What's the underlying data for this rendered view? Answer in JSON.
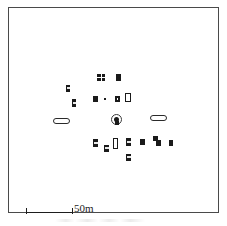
{
  "figure": {
    "width": 227,
    "height": 226,
    "background_color": "#ffffff",
    "frame_color": "#4a4a4a"
  },
  "scalebar": {
    "label": "50m",
    "bar_length_px": 47,
    "represents_meters": 50,
    "tick_style": "end-ticks",
    "color": "#1d1d1d"
  },
  "chart_data": {
    "type": "scatter",
    "subtitle": "",
    "xlabel": "",
    "ylabel": "",
    "grid": false,
    "legend_position": "none",
    "units": "meters",
    "scale_label": "50m",
    "axis_visible": false,
    "frame": true,
    "xlim": [
      0,
      211
    ],
    "ylim": [
      0,
      206
    ],
    "note": "Plan view of structures; coordinates are plot-area pixel positions with origin at the frame top-left.",
    "markers": [
      {
        "id": "s01",
        "style": "grid",
        "x": 88,
        "y": 66,
        "w": 8,
        "h": 7
      },
      {
        "id": "s02",
        "style": "solid",
        "x": 107,
        "y": 66,
        "w": 5,
        "h": 7
      },
      {
        "id": "s03",
        "style": "split",
        "x": 57,
        "y": 77,
        "w": 4,
        "h": 7
      },
      {
        "id": "s04",
        "style": "split",
        "x": 63,
        "y": 91,
        "w": 4,
        "h": 8
      },
      {
        "id": "s05",
        "style": "solid",
        "x": 84,
        "y": 88,
        "w": 5,
        "h": 6
      },
      {
        "id": "s06",
        "style": "solid",
        "x": 95,
        "y": 90,
        "w": 2,
        "h": 2
      },
      {
        "id": "s07",
        "style": "dot",
        "x": 106,
        "y": 88,
        "w": 5,
        "h": 6
      },
      {
        "id": "s08",
        "style": "hollow",
        "x": 116,
        "y": 85,
        "w": 6,
        "h": 9
      },
      {
        "id": "s09",
        "style": "stadium",
        "x": 44,
        "y": 110,
        "w": 17,
        "h": 6
      },
      {
        "id": "s10",
        "style": "circled",
        "x": 102,
        "y": 106,
        "w": 11,
        "h": 11
      },
      {
        "id": "s11",
        "style": "stadium",
        "x": 141,
        "y": 107,
        "w": 17,
        "h": 6
      },
      {
        "id": "s12",
        "style": "split",
        "x": 84,
        "y": 131,
        "w": 5,
        "h": 8
      },
      {
        "id": "s13",
        "style": "split",
        "x": 95,
        "y": 137,
        "w": 5,
        "h": 7
      },
      {
        "id": "s14",
        "style": "hollow",
        "x": 104,
        "y": 130,
        "w": 5,
        "h": 11
      },
      {
        "id": "s15",
        "style": "split",
        "x": 117,
        "y": 130,
        "w": 5,
        "h": 8
      },
      {
        "id": "s16",
        "style": "solid",
        "x": 131,
        "y": 131,
        "w": 5,
        "h": 6
      },
      {
        "id": "s17",
        "style": "solid",
        "x": 144,
        "y": 128,
        "w": 5,
        "h": 5
      },
      {
        "id": "s18",
        "style": "solid",
        "x": 147,
        "y": 132,
        "w": 5,
        "h": 6
      },
      {
        "id": "s19",
        "style": "solid",
        "x": 160,
        "y": 132,
        "w": 4,
        "h": 6
      },
      {
        "id": "s20",
        "style": "split",
        "x": 117,
        "y": 146,
        "w": 5,
        "h": 7
      }
    ]
  }
}
